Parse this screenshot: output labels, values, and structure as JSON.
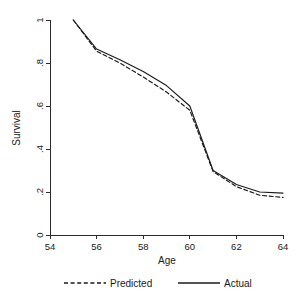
{
  "chart_data": {
    "type": "line",
    "title": "",
    "xlabel": "Age",
    "ylabel": "Survival",
    "xlim": [
      54,
      64
    ],
    "ylim": [
      0,
      1
    ],
    "xticks": [
      54,
      56,
      58,
      60,
      62,
      64
    ],
    "xticklabels": [
      "54",
      "56",
      "58",
      "60",
      "62",
      "64"
    ],
    "yticks": [
      0,
      0.2,
      0.4,
      0.6,
      0.8,
      1
    ],
    "yticklabels": [
      "0",
      ".2",
      ".4",
      ".6",
      ".8",
      "1"
    ],
    "grid": false,
    "legend_position": "bottom",
    "x": [
      55,
      56,
      57,
      58,
      59,
      60,
      61,
      62,
      63,
      64
    ],
    "series": [
      {
        "name": "Predicted",
        "style": "dashed",
        "values": [
          1.0,
          0.855,
          0.8,
          0.735,
          0.665,
          0.58,
          0.295,
          0.225,
          0.185,
          0.175
        ]
      },
      {
        "name": "Actual",
        "style": "solid",
        "values": [
          1.0,
          0.865,
          0.815,
          0.76,
          0.695,
          0.6,
          0.3,
          0.235,
          0.2,
          0.195
        ]
      }
    ]
  },
  "legend": {
    "entries": [
      {
        "label": "Predicted",
        "style": "dashed"
      },
      {
        "label": "Actual",
        "style": "solid"
      }
    ]
  },
  "colors": {
    "line": "#1a1a1a",
    "axis": "#2b2b2b",
    "background": "#ffffff"
  }
}
